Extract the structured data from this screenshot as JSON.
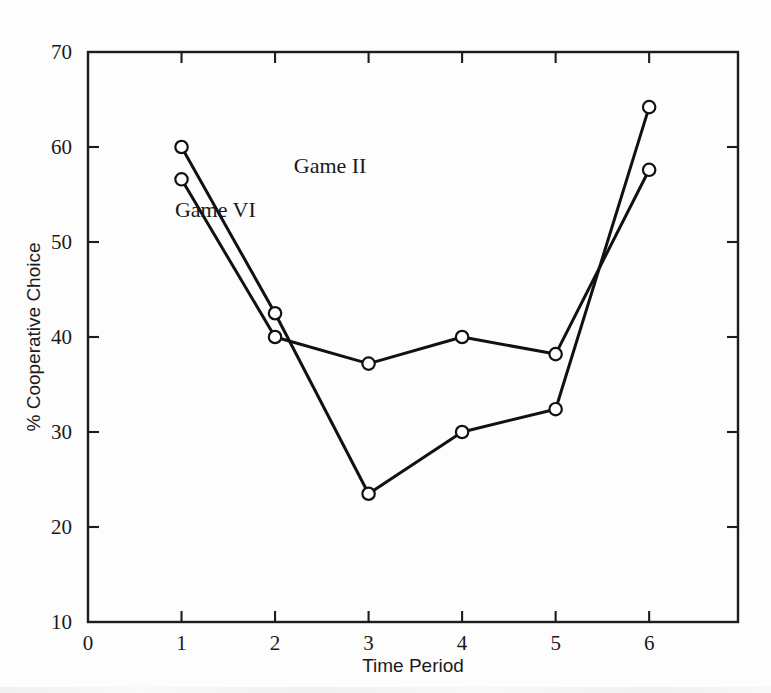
{
  "chart_data": {
    "type": "line",
    "title": "",
    "subtitle": "",
    "xlabel": "Time Period",
    "ylabel": "% Cooperative Choice",
    "x": [
      1,
      2,
      3,
      4,
      5,
      6
    ],
    "xlim": [
      0,
      6.95
    ],
    "ylim": [
      10,
      70
    ],
    "xticks": [
      0,
      1,
      2,
      3,
      4,
      5,
      6
    ],
    "xtick_labels": [
      "0",
      "1",
      "2",
      "3",
      "4",
      "5",
      "6"
    ],
    "yticks": [
      10,
      20,
      30,
      40,
      50,
      60,
      70
    ],
    "ytick_labels": [
      "10",
      "20",
      "30",
      "40",
      "50",
      "60",
      "70"
    ],
    "grid": false,
    "legend_position": "inline-annotations",
    "marker": "open-circle",
    "line_color": "#111111",
    "marker_fill": "#ffffff",
    "series": [
      {
        "name": "Game II",
        "label": "Game II",
        "values": [
          60.0,
          42.5,
          23.5,
          30.0,
          32.4,
          64.2
        ],
        "label_x": 2.2,
        "label_y": 57.3
      },
      {
        "name": "Game VI",
        "label": "Game VI",
        "values": [
          56.6,
          40.0,
          37.2,
          40.0,
          38.2,
          57.6
        ],
        "label_x": 0.93,
        "label_y": 52.6
      }
    ],
    "annotations": [
      {
        "text": "Game II",
        "x": 2.2,
        "y": 57.3
      },
      {
        "text": "Game VI",
        "x": 0.93,
        "y": 52.6
      }
    ]
  },
  "axes": {
    "x_axis_title": "Time Period",
    "y_axis_title": "% Cooperative Choice"
  }
}
